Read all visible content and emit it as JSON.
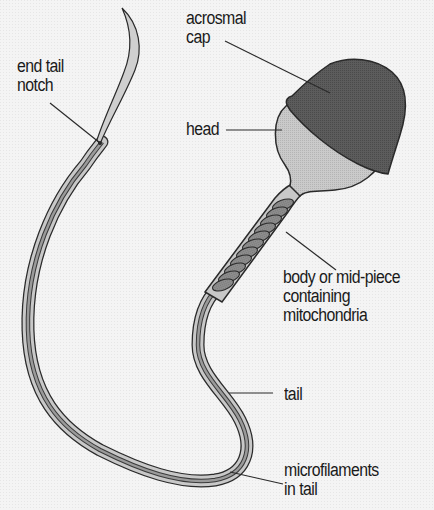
{
  "diagram": {
    "labels": {
      "acrosomal_cap": {
        "line1": "acrosmal",
        "line2": "cap"
      },
      "end_tail_notch": {
        "line1": "end tail",
        "line2": "notch"
      },
      "head": "head",
      "midpiece": {
        "line1": "body or mid-piece",
        "line2": "containing",
        "line3": "mitochondria"
      },
      "tail": "tail",
      "microfilaments": {
        "line1": "microfilaments",
        "line2": "in tail"
      }
    },
    "colors": {
      "background": "#f4f4f4",
      "cap": "#5a5a5a",
      "head": "#c4c4c4",
      "tail_fill": "#c8c8c8",
      "tail_core": "#8a8a8a",
      "outline": "#2a2a2a",
      "mitochondria": "#8c8c8c"
    }
  }
}
